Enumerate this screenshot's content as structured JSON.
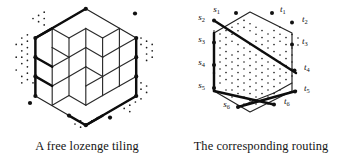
{
  "figure": {
    "background_color": "#ffffff",
    "ink_color": "#111111",
    "panels": [
      {
        "id": "lozenge-tiling",
        "caption": "A free lozenge tiling",
        "kind": "lozenge-tiling-of-hexagon",
        "hexagon_side": 3,
        "description": "A hexagon of side 3 tiled by rhombi (lozenges) in three orientations, drawn in isometric projection so the tiling reads as a stack of unit cubes; lattice points outside the hexagon are shown as small dots and the six boundary corner points as large dots."
      },
      {
        "id": "corresponding-routing",
        "caption": "The corresponding routing",
        "kind": "non-intersecting-lattice-paths",
        "hexagon_side": 3,
        "description": "The same hexagon with the dual routing: six heavy paths join the sources on the left boundary to the sinks on the right boundary, drawn over a triangular lattice of small dots.",
        "sources": [
          {
            "label": "s",
            "index": "1"
          },
          {
            "label": "s",
            "index": "2"
          },
          {
            "label": "s",
            "index": "3"
          },
          {
            "label": "s",
            "index": "4"
          },
          {
            "label": "s",
            "index": "5"
          },
          {
            "label": "s",
            "index": "6"
          }
        ],
        "sinks": [
          {
            "label": "t",
            "index": "1"
          },
          {
            "label": "t",
            "index": "2"
          },
          {
            "label": "t",
            "index": "3"
          },
          {
            "label": "t",
            "index": "4"
          },
          {
            "label": "t",
            "index": "5"
          },
          {
            "label": "t",
            "index": "6"
          }
        ],
        "routing_pairs": [
          {
            "from": "s1",
            "to": "t1"
          },
          {
            "from": "s2",
            "to": "t4"
          },
          {
            "from": "s3",
            "to": "t3"
          },
          {
            "from": "s4",
            "to": "t2"
          },
          {
            "from": "s5",
            "to": "t6"
          },
          {
            "from": "s6",
            "to": "t5"
          }
        ]
      }
    ]
  }
}
